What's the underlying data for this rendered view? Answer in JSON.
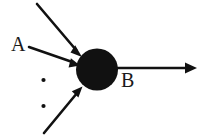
{
  "figure": {
    "background_color": "#ffffff",
    "ink_color": "#111111",
    "width": 207,
    "height": 136
  },
  "labels": {
    "input_label": "A",
    "output_label": "B"
  },
  "soma": {
    "name": "soma-node",
    "shape": "circle",
    "center_x": 97,
    "center_y": 69.5,
    "radius": 21,
    "fill": "#111111"
  },
  "input_arrows": [
    {
      "name": "input-arrow-top",
      "x1": 37,
      "y1": 4,
      "x2": 81,
      "y2": 56
    },
    {
      "name": "input-arrow-a",
      "x1": 29,
      "y1": 47,
      "x2": 78,
      "y2": 64
    },
    {
      "name": "input-arrow-bottom",
      "x1": 44,
      "y1": 133,
      "x2": 81,
      "y2": 88
    }
  ],
  "output_arrow": {
    "name": "output-arrow",
    "x1": 114,
    "y1": 68,
    "x2": 197,
    "y2": 68
  },
  "ellipsis_dots": [
    {
      "name": "ellipsis-dot-1",
      "cx": 43.5,
      "cy": 80,
      "r": 2.1
    },
    {
      "name": "ellipsis-dot-2",
      "cx": 43.5,
      "cy": 106,
      "r": 2.1
    }
  ]
}
